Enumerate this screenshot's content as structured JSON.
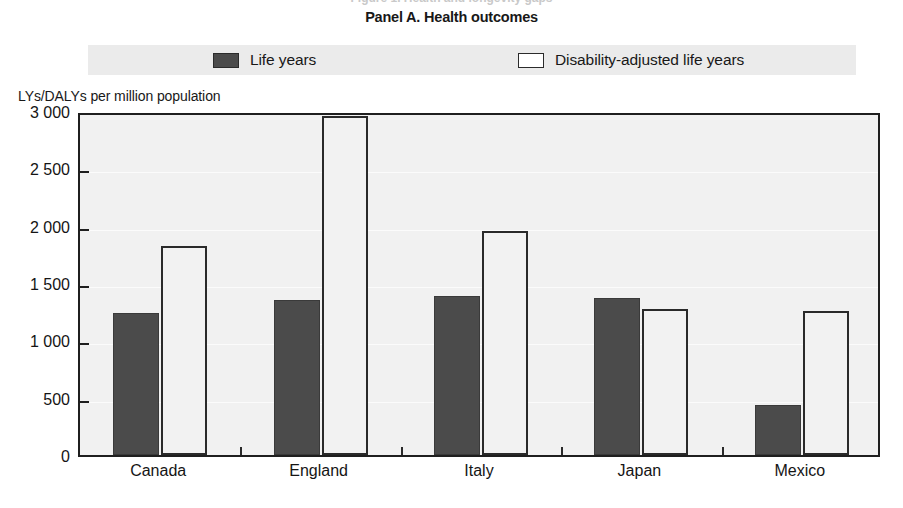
{
  "clipped_top_text": "Figure 1. Health and longevity gaps",
  "panel": {
    "title": "Panel A. Health outcomes"
  },
  "legend": {
    "entries": [
      {
        "label": "Life years",
        "swatch": "filled-dark-square-swatch",
        "color": "#4b4b4b"
      },
      {
        "label": "Disability-adjusted life years",
        "swatch": "hollow-white-square-swatch",
        "color": "#ffffff"
      }
    ],
    "band_color": "#ebebeb"
  },
  "axis": {
    "y_caption": "LYs/DALYs per million population",
    "y_tick_labels": [
      "3 000",
      "2 500",
      "2 000",
      "1 500",
      "1 000",
      "500",
      "0"
    ],
    "y_tick_values": [
      3000,
      2500,
      2000,
      1500,
      1000,
      500,
      0
    ]
  },
  "colors": {
    "plot_background": "#f1f1f1",
    "frame": "#1f1f1f",
    "life_years": "#4b4b4b",
    "daly": "#f2f2f2",
    "daly_border": "#2a2a2a",
    "legend_band": "#ebebeb",
    "text": "#151515"
  },
  "chart_data": {
    "type": "bar",
    "title": "Panel A. Health outcomes",
    "xlabel": "",
    "ylabel": "LYs/DALYs per million population",
    "ylim": [
      0,
      3000
    ],
    "yticks": [
      0,
      500,
      1000,
      1500,
      2000,
      2500,
      3000
    ],
    "grid": true,
    "legend_position": "top",
    "categories": [
      "Canada",
      "England",
      "Italy",
      "Japan",
      "Mexico"
    ],
    "series": [
      {
        "name": "Life years",
        "values": [
          1240,
          1350,
          1390,
          1370,
          435
        ]
      },
      {
        "name": "Disability-adjusted life years",
        "values": [
          1820,
          2955,
          1955,
          1275,
          1255
        ]
      }
    ]
  }
}
